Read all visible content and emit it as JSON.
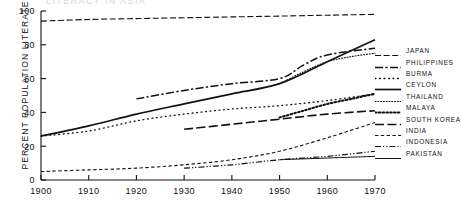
{
  "chart_data": {
    "type": "line",
    "title": "LITERACY IN ASIA",
    "xlabel": "",
    "ylabel": "PERCENT POPULATION LITERATE",
    "xlim": [
      1900,
      1970
    ],
    "ylim": [
      0,
      100
    ],
    "xticks": [
      "1900",
      "1910",
      "1920",
      "1930",
      "1940",
      "1950",
      "1960",
      "1970"
    ],
    "yticks": [
      "0",
      "20",
      "40",
      "60",
      "80",
      "100"
    ],
    "grid": false,
    "legend_position": "right",
    "series": [
      {
        "name": "JAPAN",
        "style": "dashed",
        "x": [
          1900,
          1910,
          1920,
          1930,
          1940,
          1950,
          1960,
          1970
        ],
        "values": [
          94,
          95,
          95.5,
          96,
          96.5,
          97,
          97.5,
          98
        ]
      },
      {
        "name": "PHILIPPINES",
        "style": "dash-dot",
        "x": [
          1920,
          1930,
          1940,
          1950,
          1955,
          1960,
          1970
        ],
        "values": [
          48,
          53,
          57,
          60,
          68,
          74,
          78
        ]
      },
      {
        "name": "BURMA",
        "style": "dotted-sparse",
        "x": [
          1900,
          1910,
          1920,
          1930,
          1940,
          1950,
          1960,
          1970
        ],
        "values": [
          26,
          29,
          35,
          39,
          42,
          44,
          47,
          51
        ]
      },
      {
        "name": "CEYLON",
        "style": "solid-thick",
        "x": [
          1900,
          1910,
          1920,
          1930,
          1940,
          1950,
          1960,
          1970
        ],
        "values": [
          26,
          32,
          39,
          45,
          51,
          57,
          70,
          83
        ]
      },
      {
        "name": "THAILAND",
        "style": "dotted-fine",
        "x": [
          1950,
          1955,
          1960,
          1965,
          1970
        ],
        "values": [
          57,
          64,
          70,
          73,
          75
        ]
      },
      {
        "name": "MALAYA",
        "style": "dotted-bold",
        "x": [
          1950,
          1955,
          1960,
          1965,
          1970
        ],
        "values": [
          37,
          41,
          45,
          48,
          51
        ]
      },
      {
        "name": "SOUTH KOREA",
        "style": "long-dash",
        "x": [
          1930,
          1940,
          1950,
          1960,
          1970
        ],
        "values": [
          30,
          33,
          36,
          39,
          41
        ]
      },
      {
        "name": "INDIA",
        "style": "short-dash",
        "x": [
          1900,
          1910,
          1920,
          1930,
          1940,
          1950,
          1960,
          1970
        ],
        "values": [
          5,
          6,
          7,
          9,
          12,
          17,
          25,
          34
        ]
      },
      {
        "name": "INDONESIA",
        "style": "dash-dot-dot",
        "x": [
          1930,
          1940,
          1950,
          1960,
          1970
        ],
        "values": [
          7,
          9,
          12,
          14,
          17
        ]
      },
      {
        "name": "PAKISTAN",
        "style": "solid-thin",
        "x": [
          1950,
          1960,
          1970
        ],
        "values": [
          12,
          13,
          14
        ]
      }
    ]
  },
  "axis": {
    "y_title": "PERCENT POPULATION LITERATE"
  }
}
